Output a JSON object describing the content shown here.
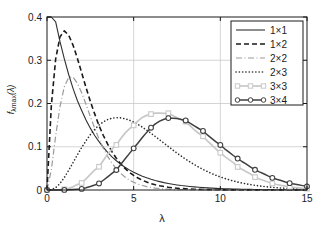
{
  "chart_data": {
    "type": "line",
    "title": "",
    "subtitle": "",
    "xlabel": "λ",
    "ylabel": "f",
    "ylabel_sub": "λmax",
    "ylabel_arg": "(λ)",
    "xlim": [
      0,
      15
    ],
    "ylim": [
      0,
      0.4
    ],
    "xticks": [
      0,
      5,
      10,
      15
    ],
    "xticklabels": [
      "0",
      "5",
      "10",
      "15"
    ],
    "yticks": [
      0,
      0.1,
      0.2,
      0.3,
      0.4
    ],
    "yticklabels": [
      "0",
      "0.1",
      "0.2",
      "0.3",
      "0.4"
    ],
    "grid": true,
    "legend_position": "top-right",
    "x": [
      0,
      0.25,
      0.5,
      0.75,
      1,
      1.25,
      1.5,
      1.75,
      2,
      2.25,
      2.5,
      2.75,
      3,
      3.25,
      3.5,
      3.75,
      4,
      4.25,
      4.5,
      4.75,
      5,
      5.25,
      5.5,
      5.75,
      6,
      6.25,
      6.5,
      6.75,
      7,
      7.25,
      7.5,
      7.75,
      8,
      8.25,
      8.5,
      8.75,
      9,
      9.25,
      9.5,
      9.75,
      10,
      10.25,
      10.5,
      10.75,
      11,
      11.25,
      11.5,
      11.75,
      12,
      12.25,
      12.5,
      12.75,
      13,
      13.25,
      13.5,
      13.75,
      14,
      14.25,
      14.5,
      14.75,
      15
    ],
    "series": [
      {
        "name": "1×1",
        "style": "solid",
        "color": "#303030",
        "marker": "none",
        "linewidth": 1.1,
        "peak_x": 0,
        "peak_y": 0.5,
        "values": [
          0.5,
          0.441,
          0.389,
          0.343,
          0.303,
          0.267,
          0.235,
          0.207,
          0.184,
          0.162,
          0.143,
          0.126,
          0.112,
          0.0985,
          0.0869,
          0.0767,
          0.0677,
          0.0597,
          0.0527,
          0.0465,
          0.041,
          0.0362,
          0.0319,
          0.0282,
          0.0249,
          0.0219,
          0.0194,
          0.0171,
          0.0151,
          0.0133,
          0.0117,
          0.0103,
          0.00916,
          0.00808,
          0.00713,
          0.00629,
          0.00555,
          0.0049,
          0.00432,
          0.00381,
          0.00336,
          0.00297,
          0.00262,
          0.00231,
          0.00204,
          0.0018,
          0.00159,
          0.0014,
          0.00124,
          0.00109,
          0.00096,
          0.00085,
          0.00075,
          0.00066,
          0.00058,
          0.00051,
          0.00045,
          0.0004,
          0.00035,
          0.00031,
          0.00028
        ]
      },
      {
        "name": "1×2",
        "style": "dashed",
        "color": "#1a1a1a",
        "marker": "none",
        "linewidth": 1.6,
        "peak_x": 1,
        "peak_y": 0.368,
        "values": [
          0,
          0.195,
          0.303,
          0.354,
          0.368,
          0.358,
          0.335,
          0.305,
          0.271,
          0.237,
          0.205,
          0.176,
          0.149,
          0.126,
          0.106,
          0.0885,
          0.0733,
          0.0605,
          0.0499,
          0.041,
          0.0337,
          0.0276,
          0.0225,
          0.0184,
          0.0149,
          0.0121,
          0.0098,
          0.0079,
          0.00638,
          0.00514,
          0.00414,
          0.00333,
          0.00268,
          0.00215,
          0.00173,
          0.00139,
          0.00111,
          0.00089,
          0.00071,
          0.00057,
          0.00045,
          0.00036,
          0.00029,
          0.00023,
          0.00018,
          0.00015,
          0.00012,
          9e-05,
          7e-05,
          6e-05,
          5e-05,
          4e-05,
          3e-05,
          2e-05,
          2e-05,
          2e-05,
          1e-05,
          1e-05,
          1e-05,
          1e-05,
          1e-05
        ]
      },
      {
        "name": "2×2",
        "style": "dashdot",
        "color": "#9a9a9a",
        "marker": "none",
        "linewidth": 1.2,
        "peak_x": 2.2,
        "peak_y": 0.26,
        "values": [
          0,
          0.0465,
          0.125,
          0.193,
          0.239,
          0.26,
          0.261,
          0.247,
          0.225,
          0.198,
          0.17,
          0.143,
          0.118,
          0.0965,
          0.0778,
          0.0621,
          0.0491,
          0.0385,
          0.03,
          0.0232,
          0.0178,
          0.0136,
          0.0104,
          0.0079,
          0.00595,
          0.00447,
          0.00335,
          0.0025,
          0.00187,
          0.00139,
          0.00103,
          0.00076,
          0.00057,
          0.00042,
          0.00031,
          0.00023,
          0.00017,
          0.00012,
          9e-05,
          7e-05,
          5e-05,
          4e-05,
          3e-05,
          2e-05,
          2e-05,
          1e-05,
          1e-05,
          1e-05,
          1e-05,
          1e-05,
          0,
          0,
          0,
          0,
          0,
          0,
          0,
          0,
          0,
          0,
          0
        ]
      },
      {
        "name": "2×3",
        "style": "dotted",
        "color": "#2b2b2b",
        "marker": "none",
        "linewidth": 1.6,
        "peak_x": 4.2,
        "peak_y": 0.215,
        "values": [
          0,
          0.0008,
          0.0055,
          0.0152,
          0.029,
          0.0455,
          0.0632,
          0.0811,
          0.0982,
          0.114,
          0.128,
          0.14,
          0.15,
          0.1575,
          0.1628,
          0.166,
          0.1672,
          0.1667,
          0.1648,
          0.1615,
          0.157,
          0.1515,
          0.1453,
          0.1385,
          0.1313,
          0.1237,
          0.116,
          0.1082,
          0.1005,
          0.0928,
          0.0854,
          0.0782,
          0.0713,
          0.0648,
          0.0587,
          0.0529,
          0.0476,
          0.0427,
          0.0381,
          0.034,
          0.0302,
          0.0268,
          0.0237,
          0.0209,
          0.0184,
          0.0162,
          0.0142,
          0.0124,
          0.0108,
          0.0094,
          0.0082,
          0.0071,
          0.0062,
          0.0053,
          0.0046,
          0.004,
          0.0034,
          0.003,
          0.0026,
          0.0022,
          0.0019
        ]
      },
      {
        "name": "3×3",
        "style": "solid",
        "color": "#c8c8c8",
        "marker": "square",
        "linewidth": 1.7,
        "peak_x": 5.5,
        "peak_y": 0.176,
        "marker_x": [
          0,
          1,
          2,
          3,
          4,
          5,
          6,
          7,
          8,
          9,
          10,
          11,
          12,
          13,
          14,
          15
        ],
        "marker_y": [
          0,
          0.0015,
          0.0162,
          0.0537,
          0.1042,
          0.1494,
          0.1755,
          0.1775,
          0.158,
          0.1241,
          0.0861,
          0.0533,
          0.0298,
          0.0152,
          0.0072,
          0.0032
        ],
        "values": [
          0,
          0,
          0.0001,
          0.0004,
          0.0015,
          0.0037,
          0.0073,
          0.0125,
          0.0162,
          0.0255,
          0.0362,
          0.0458,
          0.0537,
          0.0684,
          0.0832,
          0.0945,
          0.1042,
          0.1185,
          0.1315,
          0.1415,
          0.1494,
          0.1598,
          0.1678,
          0.1725,
          0.1755,
          0.1776,
          0.1779,
          0.1772,
          0.1775,
          0.1722,
          0.1672,
          0.1625,
          0.158,
          0.1488,
          0.1392,
          0.1312,
          0.1241,
          0.1138,
          0.1041,
          0.0948,
          0.0861,
          0.0779,
          0.0703,
          0.0632,
          0.0533,
          0.048,
          0.0421,
          0.0368,
          0.0298,
          0.0256,
          0.0219,
          0.0186,
          0.0152,
          0.0128,
          0.0107,
          0.0089,
          0.0072,
          0.0059,
          0.0048,
          0.0039,
          0.0032
        ]
      },
      {
        "name": "3×4",
        "style": "solid",
        "color": "#404040",
        "marker": "circle",
        "linewidth": 1.5,
        "peak_x": 7,
        "peak_y": 0.166,
        "marker_x": [
          0,
          1,
          2,
          3,
          4,
          5,
          6,
          7,
          8,
          9,
          10,
          11,
          12,
          13,
          14,
          15
        ],
        "marker_y": [
          0,
          0.0002,
          0.0025,
          0.0151,
          0.0462,
          0.0963,
          0.1441,
          0.1662,
          0.1608,
          0.1365,
          0.1042,
          0.0727,
          0.0467,
          0.0281,
          0.0158,
          0.0084
        ],
        "values": [
          0,
          0,
          0,
          0.0001,
          0.0002,
          0.0006,
          0.0012,
          0.0018,
          0.0025,
          0.0052,
          0.0082,
          0.0115,
          0.0151,
          0.0226,
          0.0303,
          0.0383,
          0.0462,
          0.059,
          0.0716,
          0.0841,
          0.0963,
          0.1088,
          0.1212,
          0.1332,
          0.1441,
          0.1528,
          0.1592,
          0.1637,
          0.1662,
          0.1661,
          0.1652,
          0.1632,
          0.1608,
          0.1545,
          0.1485,
          0.1422,
          0.1365,
          0.1276,
          0.1194,
          0.1114,
          0.1042,
          0.0953,
          0.0877,
          0.0798,
          0.0727,
          0.0659,
          0.0597,
          0.0529,
          0.0467,
          0.0419,
          0.0375,
          0.0326,
          0.0281,
          0.0248,
          0.0218,
          0.0186,
          0.0158,
          0.0138,
          0.0119,
          0.0101,
          0.0084
        ]
      }
    ]
  },
  "legend": {
    "items": [
      {
        "label": "1×1"
      },
      {
        "label": "1×2"
      },
      {
        "label": "2×2"
      },
      {
        "label": "2×3"
      },
      {
        "label": "3×3"
      },
      {
        "label": "3×4"
      }
    ]
  },
  "colors": {
    "axis": "#1a1a1a",
    "grid": "#c9c9c9",
    "background": "#ffffff"
  }
}
